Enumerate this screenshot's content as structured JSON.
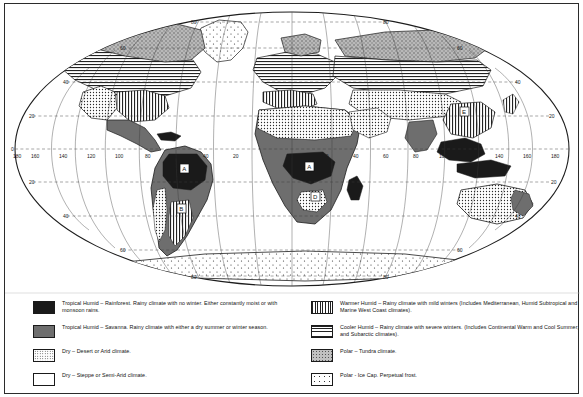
{
  "map": {
    "title": "World Climate Regions Map",
    "projection": "Mollweide-style oval world projection",
    "grid": {
      "latitude_labels": [
        "80",
        "60",
        "40",
        "20",
        "0",
        "20",
        "40",
        "60",
        "80"
      ],
      "longitude_labels": [
        "160",
        "140",
        "120",
        "100",
        "80",
        "60",
        "40",
        "20",
        "0",
        "20",
        "40",
        "60",
        "80",
        "100",
        "120",
        "140",
        "160",
        "180"
      ],
      "equator_label": "0",
      "left_edge_label": "180",
      "right_edge_label": "180"
    },
    "region_markers": [
      {
        "code": "A",
        "name": "tropical-humid-rainforest-south-america"
      },
      {
        "code": "A",
        "name": "tropical-humid-rainforest-africa"
      },
      {
        "code": "A",
        "name": "tropical-humid-rainforest-southeast-asia"
      },
      {
        "code": "B",
        "name": "tropical-savanna-south-america"
      },
      {
        "code": "C",
        "name": "dry-desert-north-america"
      },
      {
        "code": "D",
        "name": "dry-steppe-africa"
      },
      {
        "code": "E",
        "name": "warmer-humid-asia"
      },
      {
        "code": "F",
        "name": "cooler-humid-north-america"
      }
    ]
  },
  "legend": {
    "items": [
      {
        "id": "tropical-humid-rainforest",
        "symbol": "A",
        "fill": "#1a1a1a",
        "pattern": "solid-black",
        "text": "Tropical Humid – Rainforest.  Rainy climate with no winter.  Either constantly moist or with monsoon rains."
      },
      {
        "id": "tropical-savanna",
        "symbol": "B",
        "fill": "#6e6e6e",
        "pattern": "solid-gray",
        "text": "Tropical Humid – Savanna.  Rainy climate with either a dry summer or winter season."
      },
      {
        "id": "dry-desert-arid",
        "symbol": "C",
        "fill": "#ffffff",
        "pattern": "fine-stipple",
        "text": "Dry – Desert or Arid climate."
      },
      {
        "id": "dry-steppe-semiarid",
        "symbol": "D",
        "fill": "#ffffff",
        "pattern": "plain-white",
        "text": "Dry – Steppe or Semi-Arid climate."
      },
      {
        "id": "warmer-humid",
        "symbol": "E",
        "fill": "#ffffff",
        "pattern": "vertical-hatch",
        "text": "Warmer Humid – Rainy climate with mild  winters (Includes Mediterranean, Humid Subtropical and Marine West Coast climates)."
      },
      {
        "id": "cooler-humid",
        "symbol": "F",
        "fill": "#ffffff",
        "pattern": "horizontal-hatch",
        "text": "Cooler Humid – Rainy climate with severe winters. (Includes Continental Warm and Cool Summer, and Subarctic climates)."
      },
      {
        "id": "polar-tundra",
        "symbol": "G",
        "fill": "#c9c9c9",
        "pattern": "gray-stipple",
        "text": "Polar – Tundra climate."
      },
      {
        "id": "polar-ice-cap",
        "symbol": "H",
        "fill": "#ffffff",
        "pattern": "sparse-dots",
        "text": "Polar - Ice Cap. Perpetual frost."
      }
    ]
  }
}
